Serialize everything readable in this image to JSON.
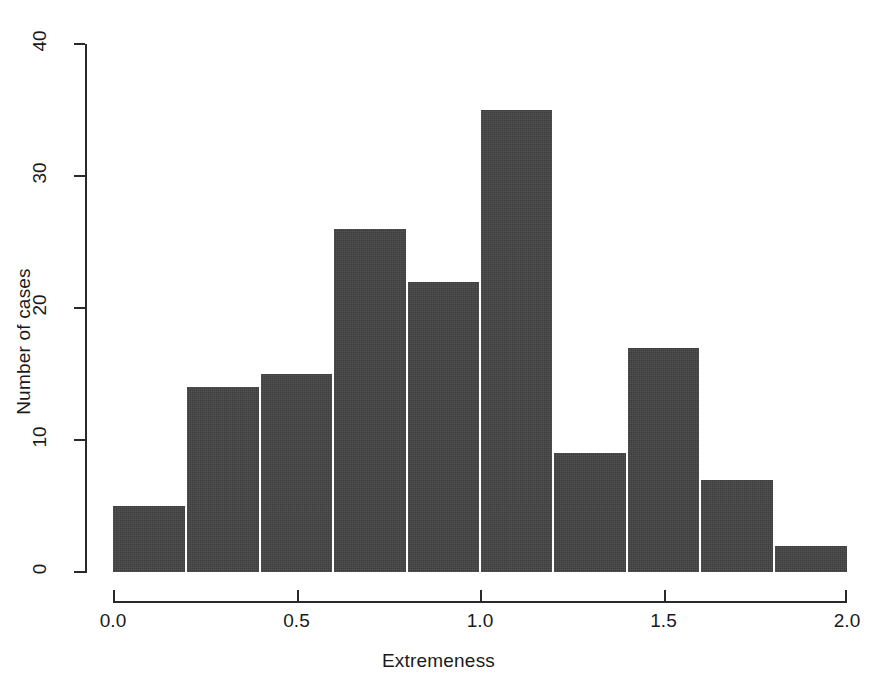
{
  "chart_data": {
    "type": "bar",
    "title": "",
    "subtitle": "",
    "xlabel": "Extremeness",
    "ylabel": "Number of cases",
    "xlim": [
      0.0,
      2.0
    ],
    "ylim": [
      0,
      40
    ],
    "grid": false,
    "legend": null,
    "bin_width": 0.2,
    "bin_edges": [
      0.0,
      0.2,
      0.4,
      0.6,
      0.8,
      1.0,
      1.2,
      1.4,
      1.6,
      1.8,
      2.0
    ],
    "categories": [
      "0.0-0.2",
      "0.2-0.4",
      "0.4-0.6",
      "0.6-0.8",
      "0.8-1.0",
      "1.0-1.2",
      "1.2-1.4",
      "1.4-1.6",
      "1.6-1.8",
      "1.8-2.0"
    ],
    "values": [
      5,
      14,
      15,
      26,
      22,
      35,
      9,
      17,
      7,
      2
    ],
    "xticks": [
      {
        "value": 0.0,
        "label": "0.0"
      },
      {
        "value": 0.5,
        "label": "0.5"
      },
      {
        "value": 1.0,
        "label": "1.0"
      },
      {
        "value": 1.5,
        "label": "1.5"
      },
      {
        "value": 2.0,
        "label": "2.0"
      }
    ],
    "yticks": [
      {
        "value": 0,
        "label": "0"
      },
      {
        "value": 10,
        "label": "10"
      },
      {
        "value": 20,
        "label": "20"
      },
      {
        "value": 30,
        "label": "30"
      },
      {
        "value": 40,
        "label": "40"
      }
    ],
    "colors": {
      "bar_fill": "#3d3d3d",
      "bar_border": "#ffffff",
      "axis": "#2a2a2a",
      "text": "#1a1a1a",
      "background": "#ffffff"
    }
  }
}
